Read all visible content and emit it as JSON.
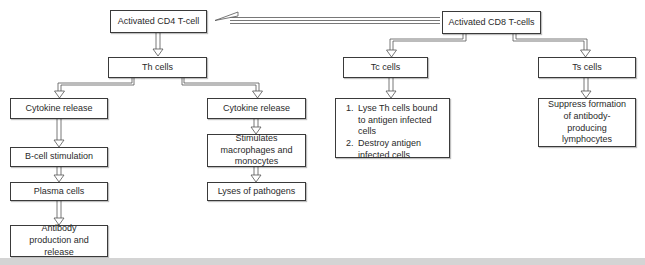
{
  "diagram": {
    "nodes": {
      "cd4": "Activated CD4 T-cell",
      "cd8": "Activated CD8 T-cells",
      "th": "Th cells",
      "tc": "Tc cells",
      "ts": "Ts cells",
      "cytokine_left": "Cytokine release",
      "cytokine_right": "Cytokine release",
      "bcell": "B-cell stimulation",
      "plasma": "Plasma cells",
      "antibody": "Antibody production and release",
      "stimulates": "Stimulates macrophages and monocytes",
      "lyses": "Lyses of pathogens",
      "tc_actions": [
        "Lyse Th cells bound to antigen infected cells",
        "Destroy antigen infected cells"
      ],
      "suppress": "Suppress formation of antibody-producing lymphocytes"
    },
    "edges": [
      [
        "cd8",
        "cd4"
      ],
      [
        "cd4",
        "th"
      ],
      [
        "th",
        "cytokine_left"
      ],
      [
        "th",
        "cytokine_right"
      ],
      [
        "cytokine_left",
        "bcell"
      ],
      [
        "bcell",
        "plasma"
      ],
      [
        "plasma",
        "antibody"
      ],
      [
        "cytokine_right",
        "stimulates"
      ],
      [
        "stimulates",
        "lyses"
      ],
      [
        "cd8",
        "tc"
      ],
      [
        "cd8",
        "ts"
      ],
      [
        "tc",
        "tc_actions"
      ],
      [
        "ts",
        "suppress"
      ]
    ],
    "colors": {
      "border": "#3a3a3a",
      "arrow": "#555555",
      "band": "#d4d4d4"
    }
  }
}
